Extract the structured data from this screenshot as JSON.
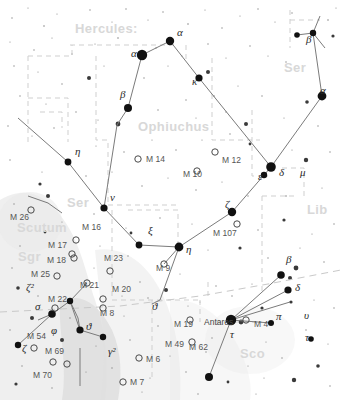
{
  "chart_data": {
    "type": "scatter",
    "xlabel": "",
    "ylabel": "",
    "grid": false,
    "legend_position": "none",
    "projection": "equatorial sky map",
    "constellation_names": [
      {
        "label": "Hercules:",
        "x": 75,
        "y": 33,
        "size": "large"
      },
      {
        "label": "Ophiuchus",
        "x": 138,
        "y": 131,
        "size": "large"
      },
      {
        "label": "Ser",
        "x": 284,
        "y": 72,
        "size": "large"
      },
      {
        "label": "Ser",
        "x": 67,
        "y": 207,
        "size": "large"
      },
      {
        "label": "Lib",
        "x": 307,
        "y": 214,
        "size": "large"
      },
      {
        "label": "Scutum",
        "x": 17,
        "y": 232,
        "size": "large"
      },
      {
        "label": "Sgr",
        "x": 18,
        "y": 261,
        "size": "large"
      },
      {
        "label": "Sco",
        "x": 240,
        "y": 358,
        "size": "large"
      }
    ],
    "greek_labels": [
      {
        "label": "α",
        "x": 177,
        "y": 36
      },
      {
        "label": "α",
        "x": 131,
        "y": 57
      },
      {
        "label": "β",
        "x": 120,
        "y": 98
      },
      {
        "label": "κ",
        "x": 192,
        "y": 85
      },
      {
        "label": "β",
        "x": 306,
        "y": 43
      },
      {
        "label": "α",
        "x": 320,
        "y": 94
      },
      {
        "label": "η",
        "x": 75,
        "y": 155
      },
      {
        "label": "ν",
        "x": 110,
        "y": 201
      },
      {
        "label": "ξ",
        "x": 148,
        "y": 234
      },
      {
        "label": "η",
        "x": 186,
        "y": 253
      },
      {
        "label": "ζ",
        "x": 225,
        "y": 208
      },
      {
        "label": "ε",
        "x": 258,
        "y": 180
      },
      {
        "label": "δ",
        "x": 279,
        "y": 176
      },
      {
        "label": "μ",
        "x": 300,
        "y": 176
      },
      {
        "label": "ϑ",
        "x": 152,
        "y": 310
      },
      {
        "label": "ϑ",
        "x": 86,
        "y": 330
      },
      {
        "label": "σ",
        "x": 35,
        "y": 310
      },
      {
        "label": "φ",
        "x": 51,
        "y": 334
      },
      {
        "label": "ζ",
        "x": 22,
        "y": 352
      },
      {
        "label": "ζ²",
        "x": 26,
        "y": 291
      },
      {
        "label": "γ²",
        "x": 108,
        "y": 355
      },
      {
        "label": "β",
        "x": 286,
        "y": 263
      },
      {
        "label": "δ",
        "x": 295,
        "y": 291
      },
      {
        "label": "π",
        "x": 276,
        "y": 320
      },
      {
        "label": "υ",
        "x": 304,
        "y": 319
      },
      {
        "label": "τ",
        "x": 305,
        "y": 341
      },
      {
        "label": "τ",
        "x": 230,
        "y": 338
      }
    ],
    "messier_objects": [
      {
        "label": "M 14",
        "lx": 146,
        "ly": 162,
        "mx": 138,
        "my": 159,
        "marker": "open"
      },
      {
        "label": "M 12",
        "lx": 222,
        "ly": 163,
        "mx": 215,
        "my": 152,
        "marker": "open"
      },
      {
        "label": "M 10",
        "lx": 183,
        "ly": 177,
        "mx": 197,
        "my": 171,
        "marker": "open"
      },
      {
        "label": "M 107",
        "lx": 213,
        "ly": 236,
        "mx": 237,
        "my": 224,
        "marker": "open"
      },
      {
        "label": "M 9",
        "lx": 156,
        "ly": 271,
        "mx": 164,
        "my": 264,
        "marker": "open"
      },
      {
        "label": "M 19",
        "lx": 174,
        "ly": 327,
        "mx": 190,
        "my": 320,
        "marker": "open"
      },
      {
        "label": "M 62",
        "lx": 189,
        "ly": 350,
        "mx": 192,
        "my": 342,
        "marker": "open"
      },
      {
        "label": "M 4",
        "lx": 254,
        "ly": 327,
        "mx": 246,
        "my": 320,
        "marker": "open"
      },
      {
        "label": "M 26",
        "lx": 10,
        "ly": 220,
        "mx": 31,
        "my": 210,
        "marker": "open"
      },
      {
        "label": "M 16",
        "lx": 82,
        "ly": 230,
        "mx": 76,
        "my": 240,
        "marker": "open"
      },
      {
        "label": "M 17",
        "lx": 48,
        "ly": 248,
        "mx": 72,
        "my": 254,
        "marker": "open"
      },
      {
        "label": "M 18",
        "lx": 47,
        "ly": 263,
        "mx": 74,
        "my": 258,
        "marker": "open"
      },
      {
        "label": "M 25",
        "lx": 31,
        "ly": 277,
        "mx": 57,
        "my": 276,
        "marker": "open"
      },
      {
        "label": "M 23",
        "lx": 104,
        "ly": 261,
        "mx": 110,
        "my": 271,
        "marker": "open"
      },
      {
        "label": "M 21",
        "lx": 80,
        "ly": 288,
        "mx": 87,
        "my": 283,
        "marker": "open"
      },
      {
        "label": "M 20",
        "lx": 112,
        "ly": 292,
        "mx": 103,
        "my": 299,
        "marker": "open"
      },
      {
        "label": "M 8",
        "lx": 100,
        "ly": 316,
        "mx": 103,
        "my": 308,
        "marker": "open"
      },
      {
        "label": "M 22",
        "lx": 48,
        "ly": 302,
        "mx": 55,
        "my": 308,
        "marker": "open"
      },
      {
        "label": "M 54",
        "lx": 27,
        "ly": 339,
        "mx": 34,
        "my": 348,
        "marker": "open"
      },
      {
        "label": "M 69",
        "lx": 45,
        "ly": 354,
        "mx": 53,
        "my": 362,
        "marker": "open"
      },
      {
        "label": "M 70",
        "lx": 33,
        "ly": 378,
        "mx": 67,
        "my": 364,
        "marker": "open"
      },
      {
        "label": "M 6",
        "lx": 146,
        "ly": 362,
        "mx": 139,
        "my": 358,
        "marker": "open"
      },
      {
        "label": "M 7",
        "lx": 130,
        "ly": 385,
        "mx": 123,
        "my": 382,
        "marker": "open"
      },
      {
        "label": "M 49",
        "lx": 165,
        "ly": 347,
        "mx": 0,
        "my": 0,
        "marker": "none"
      }
    ],
    "named_stars": [
      {
        "label": "Antares",
        "lx": 204,
        "ly": 325,
        "mx": 228,
        "my": 320
      }
    ],
    "bright_stars": [
      {
        "x": 170,
        "y": 41,
        "r": 4.2,
        "name": "ophiuchus-alpha-ras"
      },
      {
        "x": 142,
        "y": 55,
        "r": 5.2,
        "name": "hercules-alpha"
      },
      {
        "x": 128,
        "y": 108,
        "r": 4.0,
        "name": "hercules-beta"
      },
      {
        "x": 199,
        "y": 78,
        "r": 3.6,
        "name": "ophiuchus-kappa"
      },
      {
        "x": 271,
        "y": 167,
        "r": 4.8,
        "name": "ophiuchus-vertex"
      },
      {
        "x": 264,
        "y": 175,
        "r": 3.2,
        "name": "ophiuchus-epsilon"
      },
      {
        "x": 232,
        "y": 212,
        "r": 4.2,
        "name": "ophiuchus-zeta"
      },
      {
        "x": 179,
        "y": 247,
        "r": 4.4,
        "name": "ophiuchus-eta"
      },
      {
        "x": 139,
        "y": 245,
        "r": 3.4,
        "name": "ophiuchus-xi"
      },
      {
        "x": 104,
        "y": 208,
        "r": 3.6,
        "name": "ophiuchus-nu"
      },
      {
        "x": 68,
        "y": 162,
        "r": 3.4,
        "name": "serpens-eta"
      },
      {
        "x": 322,
        "y": 96,
        "r": 4.4,
        "name": "serpens-alpha"
      },
      {
        "x": 297,
        "y": 35,
        "r": 2.8,
        "name": "serpens-beta-a"
      },
      {
        "x": 313,
        "y": 33,
        "r": 3.2,
        "name": "serpens-beta-b"
      },
      {
        "x": 231,
        "y": 320,
        "r": 5.2,
        "name": "antares"
      },
      {
        "x": 281,
        "y": 275,
        "r": 3.8,
        "name": "scorpius-beta"
      },
      {
        "x": 288,
        "y": 290,
        "r": 3.6,
        "name": "scorpius-delta"
      },
      {
        "x": 271,
        "y": 323,
        "r": 3.0,
        "name": "scorpius-pi"
      },
      {
        "x": 52,
        "y": 314,
        "r": 3.8,
        "name": "sgr-sigma"
      },
      {
        "x": 80,
        "y": 330,
        "r": 3.6,
        "name": "sgr-theta"
      },
      {
        "x": 103,
        "y": 337,
        "r": 3.2,
        "name": "sgr-gamma"
      },
      {
        "x": 70,
        "y": 301,
        "r": 3.2,
        "name": "sgr-lambda"
      },
      {
        "x": 209,
        "y": 377,
        "r": 4.0,
        "name": "scorpius-lower"
      },
      {
        "x": 311,
        "y": 339,
        "r": 2.8,
        "name": "scorpius-tau2"
      },
      {
        "x": 18,
        "y": 345,
        "r": 3.2,
        "name": "sgr-zeta-star"
      }
    ],
    "ophiuchus_stick_figure": [
      [
        170,
        41
      ],
      [
        142,
        55
      ],
      [
        128,
        108
      ],
      [
        117,
        125
      ],
      [
        104,
        208
      ],
      [
        139,
        245
      ],
      [
        179,
        247
      ],
      [
        232,
        212
      ],
      [
        264,
        175
      ],
      [
        271,
        167
      ],
      [
        199,
        78
      ],
      [
        170,
        41
      ]
    ],
    "serpens_stick_figure": [
      [
        271,
        167
      ],
      [
        322,
        96
      ],
      [
        313,
        33
      ]
    ],
    "serpens_west_figure": [
      [
        104,
        208
      ],
      [
        68,
        162
      ],
      [
        18,
        120
      ]
    ]
  }
}
